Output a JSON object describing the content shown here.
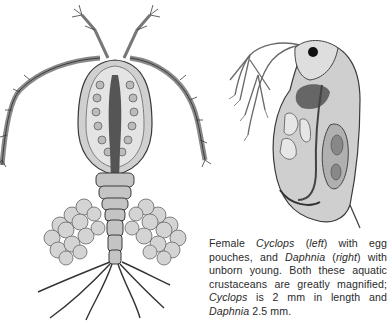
{
  "figures": [
    {
      "id": "cyclops",
      "label": "Cyclops illustration",
      "position": "left"
    },
    {
      "id": "daphnia",
      "label": "Daphnia illustration",
      "position": "right"
    }
  ],
  "caption": {
    "segments": [
      {
        "text": "Female ",
        "italic": false
      },
      {
        "text": "Cyclops",
        "italic": true
      },
      {
        "text": " (",
        "italic": false
      },
      {
        "text": "left",
        "italic": true
      },
      {
        "text": ") with egg pouches, and ",
        "italic": false
      },
      {
        "text": "Daphnia",
        "italic": true
      },
      {
        "text": " (",
        "italic": false
      },
      {
        "text": "right",
        "italic": true
      },
      {
        "text": ") with unborn young. Both these aquatic crustaceans are greatly magnified; ",
        "italic": false
      },
      {
        "text": "Cyclops",
        "italic": true
      },
      {
        "text": " is 2 mm in length and ",
        "italic": false
      },
      {
        "text": "Daphnia",
        "italic": true
      },
      {
        "text": " 2.5 mm.",
        "italic": false
      }
    ]
  },
  "colors": {
    "ink": "#3a3a3a",
    "body_fill": "#bdbdbd",
    "light_fill": "#e2e2e2",
    "dark_fill": "#555555"
  }
}
